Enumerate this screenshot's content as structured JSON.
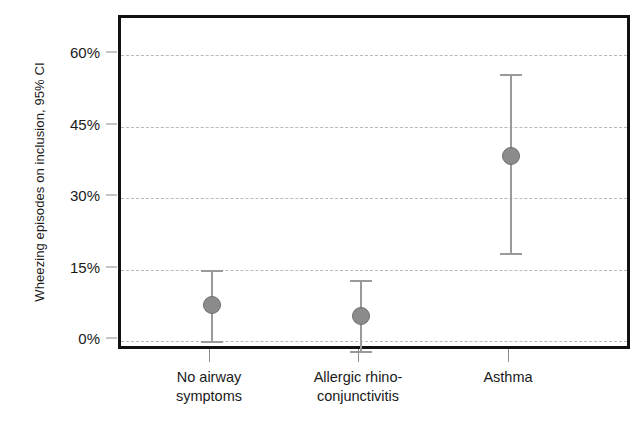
{
  "chart_data": {
    "type": "scatter",
    "title": "",
    "xlabel": "",
    "ylabel": "Wheezing episodes on inclusion, 95% CI",
    "categories": [
      "No airway symptoms",
      "Allergic rhino-conjunctivitis",
      "Asthma"
    ],
    "category_lines": [
      [
        "No airway",
        "symptoms"
      ],
      [
        "Allergic rhino-",
        "conjunctivitis"
      ],
      [
        "Asthma",
        ""
      ]
    ],
    "values": [
      7.5,
      5.2,
      38.8
    ],
    "ci_low": [
      0.0,
      -2.0,
      18.5
    ],
    "ci_high": [
      15.0,
      12.8,
      56.0
    ],
    "error_bar_type": "95% CI",
    "ylim": [
      -3,
      64
    ],
    "yticks": [
      0,
      15,
      30,
      45,
      60
    ],
    "ytick_labels": [
      "0%",
      "15%",
      "30%",
      "45%",
      "60%"
    ],
    "grid": true,
    "grid_axis": "y",
    "grid_style": "dashed",
    "legend": "none",
    "marker_color": "#8b8b8b",
    "errorbar_color": "#9a9a9a",
    "grid_color": "#b9b9b9",
    "frame_color": "#111111",
    "series": [
      {
        "name": "Wheezing episodes on inclusion",
        "points": [
          {
            "category": "No airway symptoms",
            "value": 7.5,
            "ci_low": 0.0,
            "ci_high": 15.0
          },
          {
            "category": "Allergic rhino-conjunctivitis",
            "value": 5.2,
            "ci_low": -2.0,
            "ci_high": 12.8
          },
          {
            "category": "Asthma",
            "value": 38.8,
            "ci_low": 18.5,
            "ci_high": 56.0
          }
        ]
      }
    ]
  }
}
